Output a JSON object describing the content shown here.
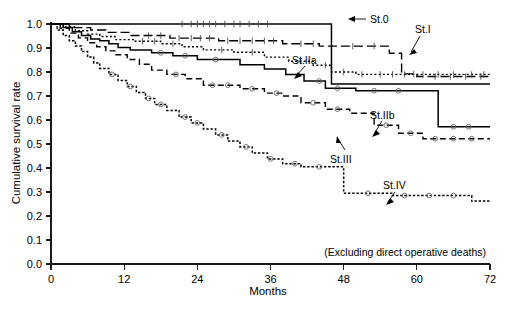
{
  "chart_data": {
    "type": "line",
    "title": "",
    "subtitle": "",
    "xlabel": "Months",
    "ylabel": "Cumulative survival rate",
    "xlim": [
      0,
      72
    ],
    "ylim": [
      0.0,
      1.0
    ],
    "xticks": [
      0,
      12,
      24,
      36,
      48,
      60,
      72
    ],
    "xticklabels": [
      "0",
      "12",
      "24",
      "36",
      "48",
      "60",
      "72"
    ],
    "yticks": [
      0.0,
      0.1,
      0.2,
      0.3,
      0.4,
      0.5,
      0.6,
      0.7,
      0.8,
      0.9,
      1.0
    ],
    "yticklabels": [
      "0.0",
      "0.1",
      "0.2",
      "0.3",
      "0.4",
      "0.5",
      "0.6",
      "0.7",
      "0.8",
      "0.9",
      "1.0"
    ],
    "grid": false,
    "legend_position": "inline-annotations",
    "annotation": "(Excluding direct operative deaths)",
    "plot_kind": "kaplan-meier-survival",
    "series": [
      {
        "name": "St.0",
        "label": "St.0",
        "linestyle": "solid",
        "final_value": 0.75,
        "points": [
          [
            0,
            1.0
          ],
          [
            46.0,
            1.0
          ],
          [
            46.0,
            0.75
          ],
          [
            72,
            0.75
          ]
        ],
        "censor_months": [
          21.5,
          23.0,
          24.0,
          25.0,
          26.0,
          27.0,
          28.5,
          30.0,
          31.0,
          32.5,
          34.0,
          35.5
        ]
      },
      {
        "name": "St.I",
        "label": "St.I",
        "linestyle": "long-dash",
        "final_value": 0.78,
        "points": [
          [
            0,
            1.0
          ],
          [
            3.0,
            1.0
          ],
          [
            3.0,
            0.985
          ],
          [
            6.5,
            0.985
          ],
          [
            6.5,
            0.975
          ],
          [
            9.0,
            0.975
          ],
          [
            9.0,
            0.965
          ],
          [
            13.0,
            0.965
          ],
          [
            13.0,
            0.952
          ],
          [
            19.5,
            0.952
          ],
          [
            19.5,
            0.941
          ],
          [
            27.5,
            0.941
          ],
          [
            27.5,
            0.93
          ],
          [
            38.0,
            0.93
          ],
          [
            38.0,
            0.918
          ],
          [
            44.0,
            0.918
          ],
          [
            44.0,
            0.908
          ],
          [
            55.5,
            0.908
          ],
          [
            55.5,
            0.878
          ],
          [
            57.5,
            0.878
          ],
          [
            57.5,
            0.792
          ],
          [
            60.0,
            0.792
          ],
          [
            60.0,
            0.781
          ],
          [
            72,
            0.781
          ]
        ],
        "censor_months": [
          16.0,
          18.0,
          21.0,
          23.0,
          24.5,
          26.0,
          29.0,
          31.0,
          33.0,
          35.0,
          36.5,
          41.0,
          43.0,
          49.5,
          53.0,
          59.5,
          63.0,
          65.5,
          68.0,
          70.5
        ]
      },
      {
        "name": "St.IIa",
        "label": "St.IIa",
        "linestyle": "fine-dotted",
        "final_value": 0.79,
        "points": [
          [
            0,
            1.0
          ],
          [
            2.0,
            1.0
          ],
          [
            2.0,
            0.988
          ],
          [
            4.0,
            0.988
          ],
          [
            4.0,
            0.972
          ],
          [
            6.0,
            0.972
          ],
          [
            6.0,
            0.958
          ],
          [
            8.0,
            0.958
          ],
          [
            8.0,
            0.948
          ],
          [
            10.5,
            0.948
          ],
          [
            10.5,
            0.935
          ],
          [
            13.5,
            0.935
          ],
          [
            13.5,
            0.928
          ],
          [
            18.0,
            0.928
          ],
          [
            18.0,
            0.918
          ],
          [
            21.5,
            0.918
          ],
          [
            21.5,
            0.905
          ],
          [
            25.0,
            0.905
          ],
          [
            25.0,
            0.892
          ],
          [
            30.0,
            0.892
          ],
          [
            30.0,
            0.882
          ],
          [
            35.0,
            0.882
          ],
          [
            35.0,
            0.862
          ],
          [
            39.0,
            0.862
          ],
          [
            39.0,
            0.845
          ],
          [
            43.0,
            0.845
          ],
          [
            43.0,
            0.828
          ],
          [
            46.0,
            0.828
          ],
          [
            46.0,
            0.8
          ],
          [
            50.0,
            0.8
          ],
          [
            50.0,
            0.79
          ],
          [
            72,
            0.79
          ]
        ],
        "censor_months": [
          15.0,
          17.0,
          20.0,
          28.0,
          33.0,
          41.0,
          45.0,
          48.0,
          51.0,
          54.0,
          56.0,
          58.0,
          61.0,
          63.5,
          66.0,
          69.0,
          71.0
        ]
      },
      {
        "name": "St.IIb",
        "label": "St.IIb",
        "linestyle": "solid",
        "final_value": 0.57,
        "points": [
          [
            0,
            1.0
          ],
          [
            2.0,
            1.0
          ],
          [
            2.0,
            0.985
          ],
          [
            3.5,
            0.985
          ],
          [
            3.5,
            0.968
          ],
          [
            5.0,
            0.968
          ],
          [
            5.0,
            0.952
          ],
          [
            6.5,
            0.952
          ],
          [
            6.5,
            0.938
          ],
          [
            8.0,
            0.938
          ],
          [
            8.0,
            0.93
          ],
          [
            9.5,
            0.93
          ],
          [
            9.5,
            0.918
          ],
          [
            11.0,
            0.918
          ],
          [
            11.0,
            0.902
          ],
          [
            13.0,
            0.902
          ],
          [
            13.0,
            0.892
          ],
          [
            16.5,
            0.892
          ],
          [
            16.5,
            0.88
          ],
          [
            20.0,
            0.88
          ],
          [
            20.0,
            0.868
          ],
          [
            24.0,
            0.868
          ],
          [
            24.0,
            0.852
          ],
          [
            31.0,
            0.852
          ],
          [
            31.0,
            0.83
          ],
          [
            35.0,
            0.83
          ],
          [
            35.0,
            0.812
          ],
          [
            38.5,
            0.812
          ],
          [
            38.5,
            0.79
          ],
          [
            41.5,
            0.79
          ],
          [
            41.5,
            0.762
          ],
          [
            45.0,
            0.762
          ],
          [
            45.0,
            0.732
          ],
          [
            50.0,
            0.732
          ],
          [
            50.0,
            0.722
          ],
          [
            63.5,
            0.722
          ],
          [
            63.5,
            0.572
          ],
          [
            72,
            0.572
          ]
        ],
        "censor_months": [
          18.0,
          22.0,
          27.0,
          44.0,
          47.0,
          53.0,
          57.0,
          66.0,
          68.5
        ]
      },
      {
        "name": "St.III",
        "label": "St.III",
        "linestyle": "dashed",
        "final_value": 0.52,
        "points": [
          [
            0,
            1.0
          ],
          [
            1.5,
            1.0
          ],
          [
            1.5,
            0.982
          ],
          [
            3.0,
            0.982
          ],
          [
            3.0,
            0.962
          ],
          [
            4.5,
            0.962
          ],
          [
            4.5,
            0.942
          ],
          [
            6.0,
            0.942
          ],
          [
            6.0,
            0.922
          ],
          [
            7.5,
            0.922
          ],
          [
            7.5,
            0.905
          ],
          [
            9.0,
            0.905
          ],
          [
            9.0,
            0.888
          ],
          [
            10.5,
            0.888
          ],
          [
            10.5,
            0.872
          ],
          [
            12.5,
            0.872
          ],
          [
            12.5,
            0.852
          ],
          [
            14.5,
            0.852
          ],
          [
            14.5,
            0.832
          ],
          [
            16.5,
            0.832
          ],
          [
            16.5,
            0.808
          ],
          [
            19.0,
            0.808
          ],
          [
            19.0,
            0.79
          ],
          [
            22.0,
            0.79
          ],
          [
            22.0,
            0.772
          ],
          [
            25.0,
            0.772
          ],
          [
            25.0,
            0.745
          ],
          [
            31.0,
            0.745
          ],
          [
            31.0,
            0.73
          ],
          [
            35.0,
            0.73
          ],
          [
            35.0,
            0.712
          ],
          [
            38.0,
            0.712
          ],
          [
            38.0,
            0.7
          ],
          [
            41.0,
            0.7
          ],
          [
            41.0,
            0.672
          ],
          [
            45.0,
            0.672
          ],
          [
            45.0,
            0.645
          ],
          [
            49.0,
            0.645
          ],
          [
            49.0,
            0.628
          ],
          [
            53.0,
            0.628
          ],
          [
            53.0,
            0.578
          ],
          [
            57.0,
            0.578
          ],
          [
            57.0,
            0.545
          ],
          [
            61.0,
            0.545
          ],
          [
            61.0,
            0.522
          ],
          [
            72,
            0.522
          ]
        ],
        "censor_months": [
          20.5,
          26.5,
          29.0,
          33.0,
          37.0,
          43.0,
          47.0,
          55.0,
          59.0,
          63.0,
          66.0,
          69.0
        ]
      },
      {
        "name": "St.IV",
        "label": "St.IV",
        "linestyle": "dense-dotted",
        "final_value": 0.26,
        "points": [
          [
            0,
            1.0
          ],
          [
            1.0,
            1.0
          ],
          [
            1.0,
            0.975
          ],
          [
            2.0,
            0.975
          ],
          [
            2.0,
            0.952
          ],
          [
            3.0,
            0.952
          ],
          [
            3.0,
            0.93
          ],
          [
            4.0,
            0.93
          ],
          [
            4.0,
            0.908
          ],
          [
            5.0,
            0.908
          ],
          [
            5.0,
            0.885
          ],
          [
            6.0,
            0.885
          ],
          [
            6.0,
            0.862
          ],
          [
            7.0,
            0.862
          ],
          [
            7.0,
            0.838
          ],
          [
            8.0,
            0.838
          ],
          [
            8.0,
            0.815
          ],
          [
            9.5,
            0.815
          ],
          [
            9.5,
            0.79
          ],
          [
            11.0,
            0.79
          ],
          [
            11.0,
            0.765
          ],
          [
            12.5,
            0.765
          ],
          [
            12.5,
            0.74
          ],
          [
            14.0,
            0.74
          ],
          [
            14.0,
            0.715
          ],
          [
            15.5,
            0.715
          ],
          [
            15.5,
            0.69
          ],
          [
            17.0,
            0.69
          ],
          [
            17.0,
            0.665
          ],
          [
            19.0,
            0.665
          ],
          [
            19.0,
            0.64
          ],
          [
            21.0,
            0.64
          ],
          [
            21.0,
            0.612
          ],
          [
            23.0,
            0.612
          ],
          [
            23.0,
            0.588
          ],
          [
            25.0,
            0.588
          ],
          [
            25.0,
            0.562
          ],
          [
            27.0,
            0.562
          ],
          [
            27.0,
            0.538
          ],
          [
            29.0,
            0.538
          ],
          [
            29.0,
            0.512
          ],
          [
            31.0,
            0.512
          ],
          [
            31.0,
            0.488
          ],
          [
            33.0,
            0.488
          ],
          [
            33.0,
            0.462
          ],
          [
            35.5,
            0.462
          ],
          [
            35.5,
            0.438
          ],
          [
            38.0,
            0.438
          ],
          [
            38.0,
            0.418
          ],
          [
            41.0,
            0.418
          ],
          [
            41.0,
            0.405
          ],
          [
            48.0,
            0.405
          ],
          [
            48.0,
            0.295
          ],
          [
            56.0,
            0.295
          ],
          [
            56.0,
            0.285
          ],
          [
            69.0,
            0.285
          ],
          [
            69.0,
            0.262
          ],
          [
            72,
            0.262
          ]
        ],
        "censor_months": [
          10.0,
          13.0,
          16.0,
          18.0,
          22.0,
          24.0,
          28.0,
          32.0,
          36.0,
          40.0,
          44.0,
          52.0,
          58.0,
          62.0,
          66.0
        ]
      }
    ]
  },
  "labels": {
    "st0": "St.0",
    "st1": "St.I",
    "st2a": "St.IIa",
    "st2b": "St.IIb",
    "st3": "St.III",
    "st4": "St.IV"
  },
  "axes": {
    "x_title": "Months",
    "y_title": "Cumulative survival rate"
  },
  "note": "(Excluding direct operative deaths)"
}
